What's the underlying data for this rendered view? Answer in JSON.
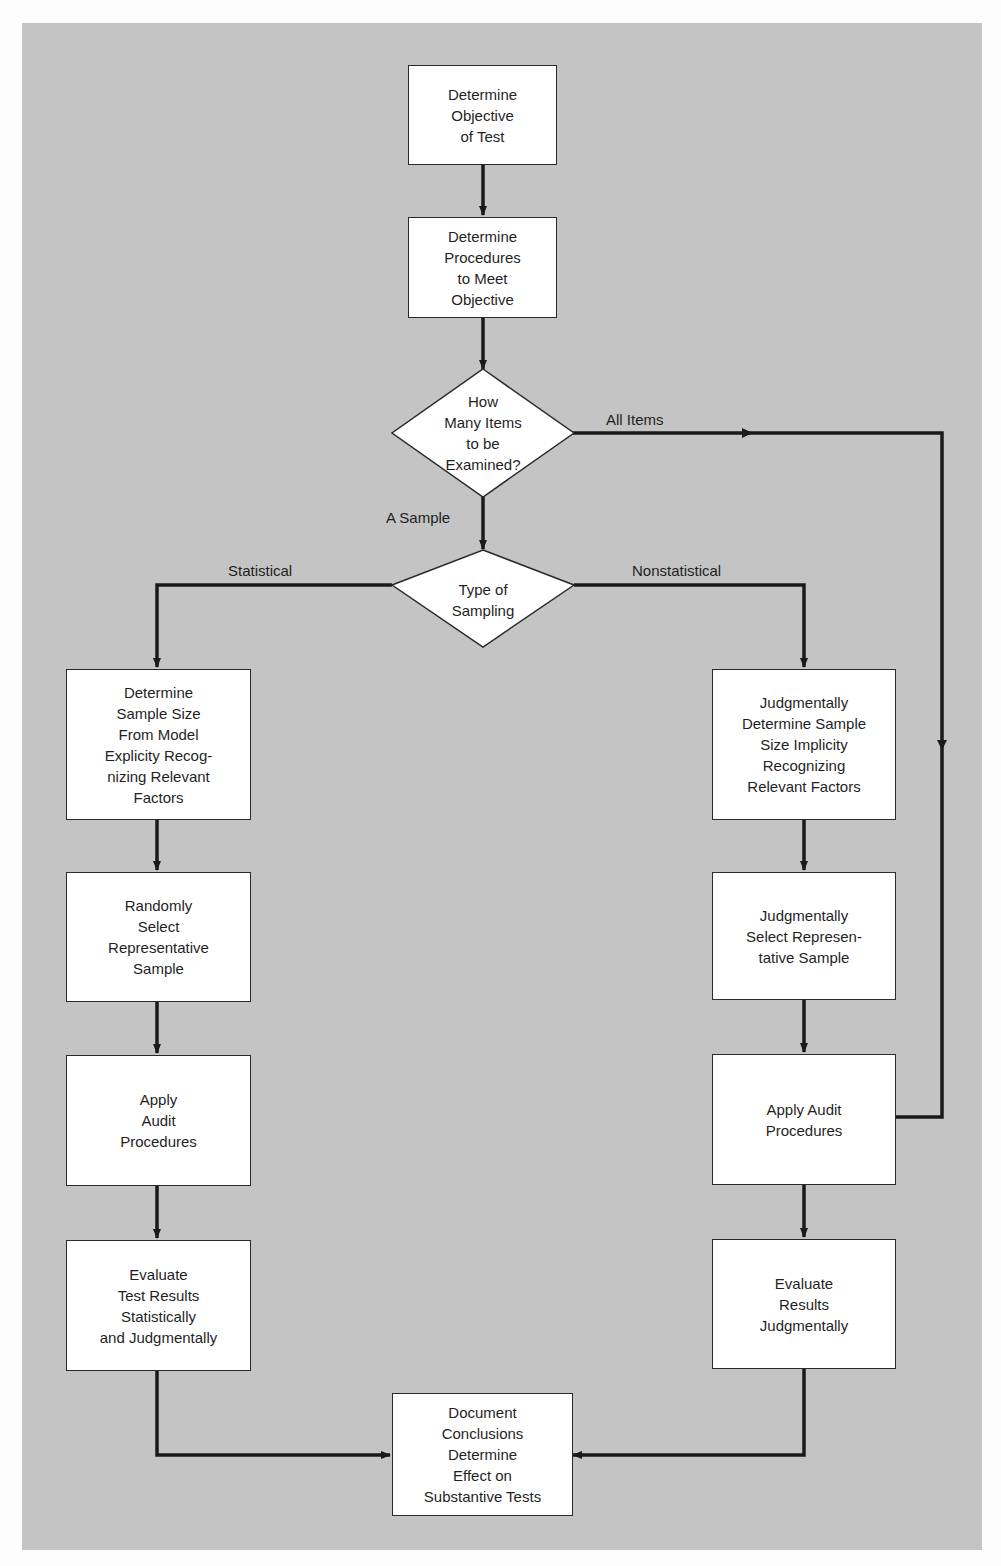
{
  "diagram": {
    "type": "flowchart",
    "background_color": "#c4c4c4",
    "node_fill": "#ffffff",
    "line_color": "#1a1a1a",
    "nodes": {
      "objective": {
        "shape": "rect",
        "label": "Determine\nObjective\nof Test"
      },
      "procedures": {
        "shape": "rect",
        "label": "Determine\nProcedures\nto Meet\nObjective"
      },
      "how_many": {
        "shape": "diamond",
        "label": "How\nMany Items\nto be\nExamined?"
      },
      "type_sampling": {
        "shape": "diamond",
        "label": "Type of\nSampling"
      },
      "stat_size": {
        "shape": "rect",
        "label": "Determine\nSample Size\nFrom Model\nExplicity Recog-\nnizing Relevant\nFactors"
      },
      "stat_select": {
        "shape": "rect",
        "label": "Randomly\nSelect\nRepresentative\nSample"
      },
      "stat_apply": {
        "shape": "rect",
        "label": "Apply\nAudit\nProcedures"
      },
      "stat_evaluate": {
        "shape": "rect",
        "label": "Evaluate\nTest Results\nStatistically\nand Judgmentally"
      },
      "nonstat_size": {
        "shape": "rect",
        "label": "Judgmentally\nDetermine Sample\nSize Implicity\nRecognizing\nRelevant Factors"
      },
      "nonstat_select": {
        "shape": "rect",
        "label": "Judgmentally\nSelect Represen-\ntative Sample"
      },
      "nonstat_apply": {
        "shape": "rect",
        "label": "Apply Audit\nProcedures"
      },
      "nonstat_evaluate": {
        "shape": "rect",
        "label": "Evaluate\nResults\nJudgmentally"
      },
      "document": {
        "shape": "rect",
        "label": "Document\nConclusions\nDetermine\nEffect on\nSubstantive Tests"
      }
    },
    "edge_labels": {
      "all_items": "All Items",
      "a_sample": "A Sample",
      "statistical": "Statistical",
      "nonstatistical": "Nonstatistical"
    },
    "edges": [
      {
        "from": "objective",
        "to": "procedures"
      },
      {
        "from": "procedures",
        "to": "how_many"
      },
      {
        "from": "how_many",
        "to": "nonstat_apply",
        "label": "All Items"
      },
      {
        "from": "how_many",
        "to": "type_sampling",
        "label": "A Sample"
      },
      {
        "from": "type_sampling",
        "to": "stat_size",
        "label": "Statistical"
      },
      {
        "from": "type_sampling",
        "to": "nonstat_size",
        "label": "Nonstatistical"
      },
      {
        "from": "stat_size",
        "to": "stat_select"
      },
      {
        "from": "stat_select",
        "to": "stat_apply"
      },
      {
        "from": "stat_apply",
        "to": "stat_evaluate"
      },
      {
        "from": "stat_evaluate",
        "to": "document"
      },
      {
        "from": "nonstat_size",
        "to": "nonstat_select"
      },
      {
        "from": "nonstat_select",
        "to": "nonstat_apply"
      },
      {
        "from": "nonstat_apply",
        "to": "nonstat_evaluate"
      },
      {
        "from": "nonstat_evaluate",
        "to": "document"
      }
    ]
  }
}
